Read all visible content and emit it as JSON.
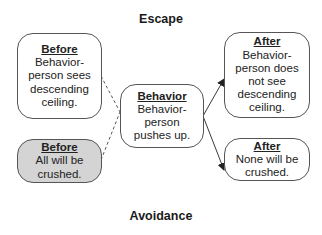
{
  "titles": {
    "top": "Escape",
    "bottom": "Avoidance"
  },
  "boxes": {
    "before_escape": {
      "heading": "Before",
      "text": "Behavior-\nperson sees\ndescending\nceiling.",
      "shaded": false
    },
    "before_avoidance": {
      "heading": "Before",
      "text": "All will be\ncrushed.",
      "shaded": true,
      "fill": "#d4d4d4"
    },
    "behavior": {
      "heading": "Behavior",
      "text": "Behavior-\nperson\npushes up.",
      "shaded": false
    },
    "after_escape": {
      "heading": "After",
      "text": "Behavior-\nperson does\nnot see\ndescending\nceiling.",
      "shaded": false
    },
    "after_avoidance": {
      "heading": "After",
      "text": "None will be\ncrushed.",
      "shaded": false
    }
  },
  "connectors": [
    {
      "from": "before_escape",
      "to": "behavior",
      "style": "dashed"
    },
    {
      "from": "before_avoidance",
      "to": "behavior",
      "style": "dashed"
    },
    {
      "from": "behavior",
      "to": "after_escape",
      "style": "solid-arrow"
    },
    {
      "from": "behavior",
      "to": "after_avoidance",
      "style": "solid-arrow"
    }
  ]
}
